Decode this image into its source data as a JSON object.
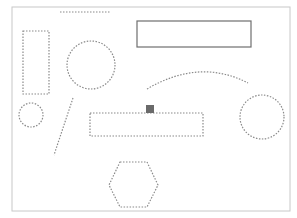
{
  "canvas": {
    "width": 297,
    "height": 218,
    "background": "#ffffff"
  },
  "colors": {
    "frame": "#c8c8c8",
    "dashed": "#8a8a8a",
    "solid": "#6e6e6e",
    "marker": "#6a6a6a"
  },
  "shapes": {
    "frame": {
      "type": "rect",
      "x": 12,
      "y": 7,
      "width": 278,
      "height": 204,
      "style": "solid"
    },
    "top_line": {
      "type": "line",
      "x1": 60,
      "y1": 12,
      "x2": 110,
      "y2": 12,
      "style": "dashed"
    },
    "solid_rect": {
      "type": "rect",
      "x": 137,
      "y": 21,
      "width": 114,
      "height": 26,
      "style": "solid"
    },
    "left_rect": {
      "type": "rect",
      "x": 23,
      "y": 31,
      "width": 26,
      "height": 63,
      "style": "dashed"
    },
    "big_circle": {
      "type": "circle",
      "cx": 91,
      "cy": 65,
      "r": 24,
      "style": "dashed"
    },
    "arc": {
      "type": "path",
      "d": "M147,89 Q200,58 248,83",
      "style": "dashed"
    },
    "small_circle": {
      "type": "circle",
      "cx": 31,
      "cy": 115,
      "r": 12,
      "style": "dashed"
    },
    "diagonal_line": {
      "type": "line",
      "x1": 73,
      "y1": 98,
      "x2": 54,
      "y2": 155,
      "style": "dashed"
    },
    "center_rect": {
      "type": "rect",
      "x": 90,
      "y": 113,
      "width": 113,
      "height": 23,
      "style": "dashed"
    },
    "marker_square": {
      "type": "rect",
      "x": 146,
      "y": 105,
      "width": 8,
      "height": 8,
      "style": "filled"
    },
    "right_circle": {
      "type": "circle",
      "cx": 262,
      "cy": 117,
      "r": 22,
      "style": "dashed"
    },
    "hexagon": {
      "type": "polygon",
      "points": "120,162 147,162 158,185 147,207 120,207 109,185",
      "style": "dashed"
    }
  }
}
